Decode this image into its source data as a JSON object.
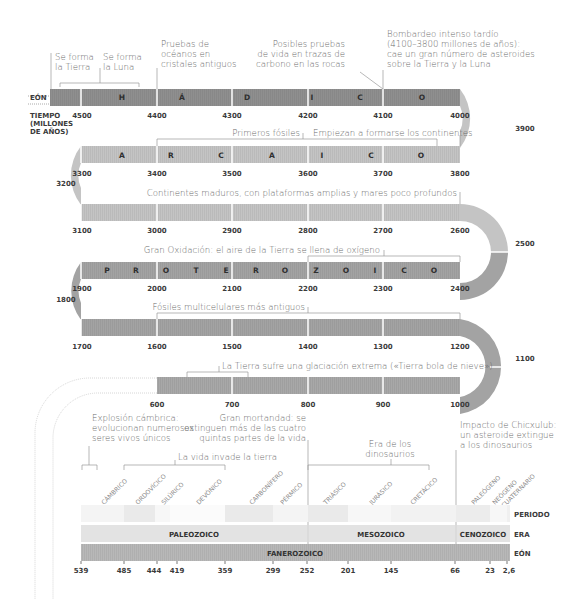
{
  "labels": {
    "eon": "EÓN",
    "time_1": "TIEMPO",
    "time_2": "(MILLONES",
    "time_3": "DE AÑOS)",
    "periodo": "PERIODO",
    "era": "ERA",
    "eon_bottom": "EÓN"
  },
  "eons": {
    "hadico": [
      "H",
      "Á",
      "D",
      "I",
      "C",
      "O"
    ],
    "arcaico": [
      "A",
      "R",
      "C",
      "A",
      "I",
      "C",
      "O"
    ],
    "proterozoico": [
      "P",
      "R",
      "O",
      "T",
      "E",
      "R",
      "O",
      "Z",
      "O",
      "I",
      "C",
      "O"
    ]
  },
  "ticks": {
    "row1": [
      "4500",
      "4400",
      "4300",
      "4200",
      "4100",
      "4000"
    ],
    "right1": "3900",
    "row2": [
      "3300",
      "3400",
      "3500",
      "3600",
      "3700",
      "3800"
    ],
    "left2": "3200",
    "row3": [
      "3100",
      "3000",
      "2900",
      "2800",
      "2700",
      "2600"
    ],
    "right3": "2500",
    "row4": [
      "1900",
      "2000",
      "2100",
      "2200",
      "2300",
      "2400"
    ],
    "left4": "1800",
    "row5": [
      "1700",
      "1600",
      "1500",
      "1400",
      "1300",
      "1200"
    ],
    "right5": "1100",
    "row6": [
      "600",
      "700",
      "800",
      "900",
      "1000"
    ],
    "bottom": [
      "539",
      "485",
      "444",
      "419",
      "359",
      "299",
      "252",
      "201",
      "145",
      "66",
      "23",
      "2,6"
    ]
  },
  "annotations": {
    "tierra_1": "Se forma",
    "tierra_2": "la Tierra",
    "luna_1": "Se forma",
    "luna_2": "la Luna",
    "oceanos_1": "Pruebas de",
    "oceanos_2": "océanos en",
    "oceanos_3": "cristales antiguos",
    "vida_1": "Posibles pruebas",
    "vida_2": "de vida en trazas de",
    "vida_3": "carbono en las rocas",
    "bomb_1": "Bombardeo intenso tardío",
    "bomb_2": "(4100–3800 millones de años):",
    "bomb_3": "cae un gran número de asteroides",
    "bomb_4": "sobre la Tierra y la Luna",
    "fosiles": "Primeros fósiles",
    "continentes": "Empiezan a formarse los continentes",
    "maduros": "Continentes maduros, con plataformas amplias y mares poco profundos",
    "oxidacion": "Gran Oxidación: el aire de la Tierra se llena de oxígeno",
    "multicel": "Fósiles multicelulares más antiguos",
    "glaciacion": "La Tierra sufre una glaciación extrema («Tierra bola de nieve»)",
    "cambrica_1": "Explosión cámbrica:",
    "cambrica_2": "evolucionan numerosos",
    "cambrica_3": "seres vivos únicos",
    "mortandad_1": "Gran mortandad: se",
    "mortandad_2": "extinguen más de las cuatro",
    "mortandad_3": "quintas partes de la vida",
    "tierra_inv": "La vida invade la tierra",
    "dino_1": "Era de los",
    "dino_2": "dinosaurios",
    "chicx_1": "Impacto de Chicxulub:",
    "chicx_2": "un asteroide extingue",
    "chicx_3": "a los dinosaurios"
  },
  "periods": [
    "CÁMBRICO",
    "ORDOVÍCICO",
    "SILÚRICO",
    "DEVÓNICO",
    "CARBONÍFERO",
    "PÉRMICO",
    "TRIÁSICO",
    "JURÁSICO",
    "CRETÁCICO",
    "PALEÓGENO",
    "NEÓGENO",
    "CUATERNARIO"
  ],
  "eras": {
    "paleozoico": "PALEOZOICO",
    "mesozoico": "MESOZOICO",
    "cenozoico": "CENOZOICO"
  },
  "fanerozoico": "FANEROZOICO",
  "colors": {
    "hadico": "#8f8f8f",
    "arcaico": "#c4c4c4",
    "proterozoico": "#a3a3a3",
    "neoproterozoico": "#a8a8a8",
    "paleozoico": "#e3e3e3",
    "fanerozoico": "#b8b8b8"
  }
}
